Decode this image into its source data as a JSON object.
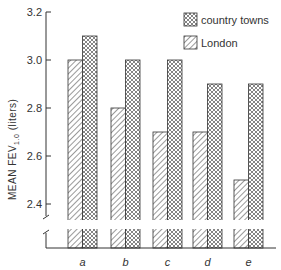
{
  "chart_data": {
    "type": "bar",
    "title": "",
    "xlabel": "",
    "ylabel": "MEAN FEV1.0 (liters)",
    "ylabel_parts": {
      "main": "MEAN FEV",
      "sub": "1.0",
      "unit": " (liters)"
    },
    "ylim": [
      2.3,
      3.2
    ],
    "axis_break": true,
    "yticks": [
      2.4,
      2.6,
      2.8,
      3.0,
      3.2
    ],
    "ytick_labels": [
      "2.4",
      "2.6",
      "2.8",
      "3.0",
      "3.2"
    ],
    "categories": [
      "a",
      "b",
      "c",
      "d",
      "e"
    ],
    "series": [
      {
        "name": "London",
        "pattern": "diagonal-hatch",
        "values": [
          3.0,
          2.8,
          2.7,
          2.7,
          2.5
        ]
      },
      {
        "name": "country towns",
        "pattern": "cross-hatch",
        "values": [
          3.1,
          3.0,
          3.0,
          2.9,
          2.9
        ]
      }
    ],
    "legend": {
      "position": "top-right",
      "entries": [
        {
          "label": "country towns",
          "pattern": "cross-hatch"
        },
        {
          "label": "London",
          "pattern": "diagonal-hatch"
        }
      ]
    },
    "grid": false
  },
  "colors": {
    "ink": "#333333",
    "background": "#ffffff"
  }
}
